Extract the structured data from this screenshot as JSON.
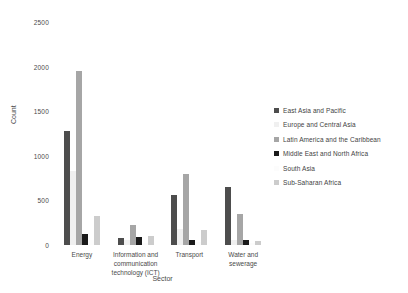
{
  "chart_data": {
    "type": "bar",
    "title": "",
    "xlabel": "Sector",
    "ylabel": "Count",
    "ylim": [
      0,
      2500
    ],
    "yticks": [
      0,
      500,
      1000,
      1500,
      2000,
      2500
    ],
    "ytick_labels": [
      "0",
      "500",
      "1000",
      "1500",
      "2000",
      "2500"
    ],
    "grid": false,
    "legend_position": "right",
    "categories": [
      "Energy",
      "Information and communication technology (ICT)",
      "Transport",
      "Water and sewerage"
    ],
    "series": [
      {
        "name": "East Asia and Pacific",
        "color": "#4d4d4d",
        "values": [
          1280,
          75,
          560,
          650
        ]
      },
      {
        "name": "Europe and Central Asia",
        "color": "#f0f0f0",
        "values": [
          830,
          60,
          175,
          60
        ]
      },
      {
        "name": "Latin America and the Caribbean",
        "color": "#a6a6a6",
        "values": [
          1950,
          225,
          800,
          350
        ]
      },
      {
        "name": "Middle East and North Africa",
        "color": "#1a1a1a",
        "values": [
          120,
          95,
          60,
          55
        ]
      },
      {
        "name": "South Asia",
        "color": "#fcfcfc",
        "values": [
          60,
          20,
          35,
          25
        ]
      },
      {
        "name": "Sub-Saharan Africa",
        "color": "#cccccc",
        "values": [
          330,
          100,
          165,
          40
        ]
      }
    ]
  },
  "axis": {
    "y_title": "Count",
    "x_title": "Sector"
  }
}
